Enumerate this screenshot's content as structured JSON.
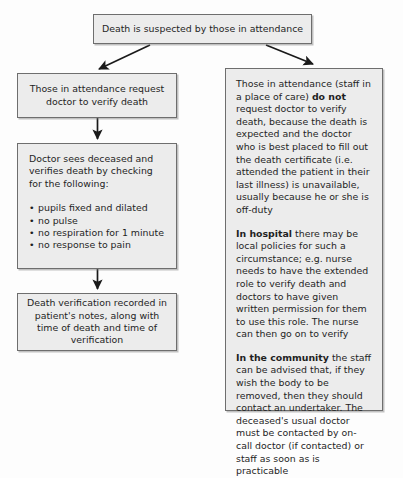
{
  "diagram": {
    "title_node": {
      "text": "Death is suspected by those in attendance"
    },
    "left_branch": {
      "request_node": {
        "text": "Those in attendance request doctor to verify death"
      },
      "verify_node": {
        "lead": "Doctor sees deceased and verifies death by checking for the following:",
        "checks": [
          "pupils fixed and dilated",
          "no pulse",
          "no respiration for 1 minute",
          "no response to pain"
        ]
      },
      "record_node": {
        "text": "Death verification recorded in patient's notes, along with time of death and time of verification"
      }
    },
    "right_branch": {
      "expected_node": {
        "para1_part1": "Those in attendance (staff in a place of care) ",
        "para1_emphasis": "do not",
        "para1_part2": " request doctor to verify death, because the death is expected and the doctor who is best placed to fill out the death certificate (i.e. attended the patient in their last illness) is unavailable, usually because he or she is off-duty",
        "para2_emphasis": "In hospital",
        "para2_text": " there may be local policies for such a circumstance; e.g. nurse needs to have the extended role to verify death and doctors to have given written permission for them to use this role. The nurse can then go on to verify",
        "para3_emphasis": "In the community",
        "para3_text": " the staff can be advised that, if they wish the body to be removed, then they should contact an undertaker. The deceased's usual doctor must be contacted by on-call doctor (if contacted) or staff as soon as is practicable"
      }
    },
    "connectors": [
      {
        "name": "root-to-request",
        "from": "title_node",
        "to": "request_node"
      },
      {
        "name": "root-to-expected",
        "from": "title_node",
        "to": "expected_node"
      },
      {
        "name": "request-to-verify",
        "from": "request_node",
        "to": "verify_node"
      },
      {
        "name": "verify-to-record",
        "from": "verify_node",
        "to": "record_node"
      }
    ],
    "colors": {
      "node_fill": "#ececec",
      "node_border": "#6e6e6e",
      "connector": "#1a1a1a",
      "page_background": "#fdfdfd",
      "text": "#1f1f1f"
    }
  }
}
